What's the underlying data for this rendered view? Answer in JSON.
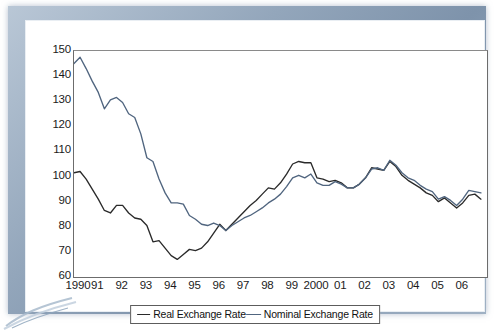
{
  "chart_data": {
    "type": "line",
    "title": "",
    "xlabel": "",
    "ylabel": "",
    "ylim": [
      60,
      150
    ],
    "yticks": [
      60,
      70,
      80,
      90,
      100,
      110,
      120,
      130,
      140,
      150
    ],
    "grid": false,
    "legend_position": "bottom-center",
    "xlim": [
      1990,
      2007
    ],
    "xticks": [
      1990,
      1991,
      1992,
      1993,
      1994,
      1995,
      1996,
      1997,
      1998,
      1999,
      2000,
      2001,
      2002,
      2003,
      2004,
      2005,
      2006
    ],
    "xtick_labels": [
      "1990",
      "91",
      "92",
      "93",
      "94",
      "95",
      "96",
      "97",
      "98",
      "99",
      "2000",
      "01",
      "02",
      "03",
      "04",
      "05",
      "06"
    ],
    "series": [
      {
        "name": "Real Exchange Rate",
        "color": "#2a2a2a",
        "x": [
          1990.0,
          1990.25,
          1990.5,
          1990.75,
          1991.0,
          1991.25,
          1991.5,
          1991.75,
          1992.0,
          1992.25,
          1992.5,
          1992.75,
          1993.0,
          1993.25,
          1993.5,
          1993.75,
          1994.0,
          1994.25,
          1994.5,
          1994.75,
          1995.0,
          1995.25,
          1995.5,
          1995.75,
          1996.0,
          1996.25,
          1996.5,
          1996.75,
          1997.0,
          1997.25,
          1997.5,
          1997.75,
          1998.0,
          1998.25,
          1998.5,
          1998.75,
          1999.0,
          1999.25,
          1999.5,
          1999.75,
          2000.0,
          2000.25,
          2000.5,
          2000.75,
          2001.0,
          2001.25,
          2001.5,
          2001.75,
          2002.0,
          2002.25,
          2002.5,
          2002.75,
          2003.0,
          2003.25,
          2003.5,
          2003.75,
          2004.0,
          2004.25,
          2004.5,
          2004.75,
          2005.0,
          2005.25,
          2005.5,
          2005.75,
          2006.0,
          2006.25,
          2006.5,
          2006.75
        ],
        "y": [
          101.5,
          102.0,
          99.0,
          95.0,
          91.0,
          86.5,
          85.5,
          88.5,
          88.5,
          85.5,
          83.5,
          83.0,
          80.5,
          74.0,
          74.5,
          71.5,
          68.5,
          67.0,
          69.0,
          71.0,
          70.5,
          71.5,
          74.0,
          77.5,
          81.0,
          78.5,
          81.0,
          83.5,
          86.0,
          88.5,
          90.5,
          93.0,
          95.5,
          95.0,
          97.5,
          101.0,
          105.0,
          106.0,
          105.5,
          105.5,
          99.5,
          99.0,
          98.0,
          98.5,
          97.5,
          95.5,
          95.5,
          97.0,
          99.5,
          103.5,
          103.0,
          102.5,
          106.0,
          104.0,
          100.5,
          98.5,
          97.0,
          95.5,
          93.5,
          92.5,
          90.0,
          91.5,
          89.5,
          87.5,
          89.5,
          92.5,
          93.0,
          91.0
        ]
      },
      {
        "name": "Nominal Exchange Rate",
        "color": "#50657f",
        "x": [
          1990.0,
          1990.25,
          1990.5,
          1990.75,
          1991.0,
          1991.25,
          1991.5,
          1991.75,
          1992.0,
          1992.25,
          1992.5,
          1992.75,
          1993.0,
          1993.25,
          1993.5,
          1993.75,
          1994.0,
          1994.25,
          1994.5,
          1994.75,
          1995.0,
          1995.25,
          1995.5,
          1995.75,
          1996.0,
          1996.25,
          1996.5,
          1996.75,
          1997.0,
          1997.25,
          1997.5,
          1997.75,
          1998.0,
          1998.25,
          1998.5,
          1998.75,
          1999.0,
          1999.25,
          1999.5,
          1999.75,
          2000.0,
          2000.25,
          2000.5,
          2000.75,
          2001.0,
          2001.25,
          2001.5,
          2001.75,
          2002.0,
          2002.25,
          2002.5,
          2002.75,
          2003.0,
          2003.25,
          2003.5,
          2003.75,
          2004.0,
          2004.25,
          2004.5,
          2004.75,
          2005.0,
          2005.25,
          2005.5,
          2005.75,
          2006.0,
          2006.25,
          2006.5,
          2006.75
        ],
        "y": [
          145.0,
          147.5,
          143.0,
          138.0,
          133.5,
          127.0,
          130.5,
          131.5,
          129.5,
          125.0,
          123.5,
          117.0,
          107.5,
          106.0,
          99.0,
          93.5,
          89.5,
          89.5,
          89.0,
          84.5,
          83.0,
          81.0,
          80.5,
          81.5,
          80.5,
          78.5,
          80.5,
          82.0,
          83.5,
          84.5,
          86.0,
          87.5,
          89.5,
          91.0,
          93.0,
          96.0,
          99.5,
          100.5,
          99.5,
          101.0,
          97.5,
          96.5,
          96.5,
          98.0,
          97.0,
          95.5,
          95.5,
          97.0,
          99.5,
          103.0,
          103.5,
          102.5,
          106.5,
          104.5,
          101.5,
          99.5,
          98.5,
          96.5,
          95.0,
          94.0,
          91.0,
          92.0,
          90.5,
          88.5,
          91.0,
          94.5,
          94.0,
          93.5
        ]
      }
    ]
  },
  "legend": {
    "items": [
      {
        "label": "Real Exchange Rate"
      },
      {
        "label": "Nominal Exchange Rate"
      }
    ]
  }
}
